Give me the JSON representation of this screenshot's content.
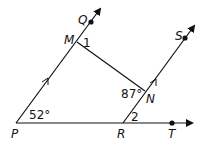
{
  "diagram": {
    "points": {
      "P": {
        "label": "P",
        "x": 16,
        "y": 123
      },
      "M": {
        "label": "M",
        "x": 77,
        "y": 42
      },
      "Q": {
        "label": "Q",
        "x": 91,
        "y": 23
      },
      "R": {
        "label": "R",
        "x": 123,
        "y": 123
      },
      "N": {
        "label": "N",
        "x": 145,
        "y": 91
      },
      "S": {
        "label": "S",
        "x": 185,
        "y": 38
      },
      "T": {
        "label": "T",
        "x": 172,
        "y": 123
      }
    },
    "angles": {
      "P": "52°",
      "N": "87°",
      "angle1": "1",
      "angle2": "2"
    },
    "rays": [
      "PQ",
      "RS",
      "PT"
    ],
    "segments": [
      "MN"
    ],
    "parallel_marks": [
      "PM",
      "RN"
    ],
    "line_color": "#111111"
  }
}
